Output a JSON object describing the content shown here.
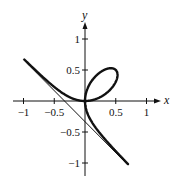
{
  "chart_data": {
    "type": "line",
    "title": "",
    "xlabel": "x",
    "ylabel": "y",
    "xlim": [
      -1.05,
      1.1
    ],
    "ylim": [
      -1.1,
      1.25
    ],
    "grid": false,
    "legend": null,
    "x_ticks": [
      -1,
      -0.5,
      0.5,
      1
    ],
    "x_tick_labels": [
      "−1",
      "−0.5",
      "0.5",
      "1"
    ],
    "y_ticks": [
      1,
      0.5,
      -0.5,
      -1
    ],
    "y_tick_labels": [
      "1",
      "0.5",
      "−0.5",
      "−1"
    ],
    "series": [
      {
        "name": "curve (folium of Descartes, x^3 + y^3 = 3axy, a = 1/3)",
        "style": "thick",
        "param": "x = 3at/(1+t^3), y = 3at^2/(1+t^3)",
        "a": 0.3333,
        "x_range": [
          -1.0,
          0.7
        ],
        "points": [
          [
            -1.0,
            0.69
          ],
          [
            -0.5,
            0.27
          ],
          [
            -0.25,
            0.06
          ],
          [
            0,
            0
          ],
          [
            0.25,
            0.06
          ],
          [
            0.5,
            0.5
          ],
          [
            0.4,
            0.53
          ],
          [
            0.06,
            0.25
          ],
          [
            0,
            0
          ],
          [
            0.06,
            -0.25
          ],
          [
            0.27,
            -0.5
          ],
          [
            0.7,
            -0.99
          ]
        ]
      },
      {
        "name": "asymptote x + y + 1/3 = 0",
        "style": "thin",
        "slope": -1,
        "intercept": -0.3333,
        "x_range": [
          -1.0,
          0.7
        ]
      }
    ]
  },
  "axes": {
    "x_label": "x",
    "y_label": "y"
  }
}
